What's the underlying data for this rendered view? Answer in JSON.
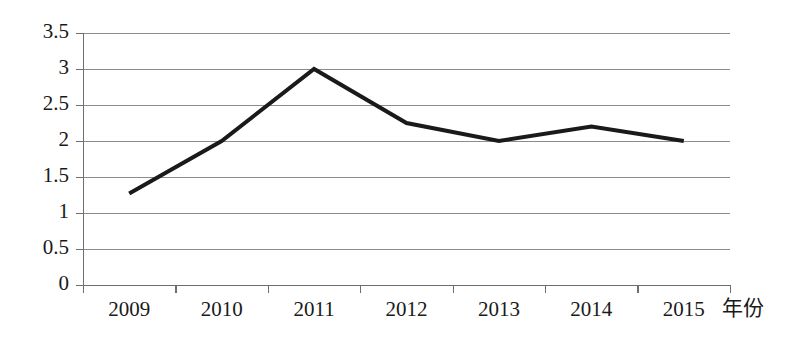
{
  "chart_data": {
    "type": "line",
    "title": "",
    "subtitle": "",
    "xlabel": "年份",
    "ylabel": "",
    "categories": [
      "2009",
      "2010",
      "2011",
      "2012",
      "2013",
      "2014",
      "2015"
    ],
    "values": [
      1.27,
      2.0,
      3.0,
      2.25,
      2.0,
      2.2,
      2.0
    ],
    "series": [
      {
        "name": "",
        "values": [
          1.27,
          2.0,
          3.0,
          2.25,
          2.0,
          2.2,
          2.0
        ]
      }
    ],
    "ylim": [
      0,
      3.5
    ],
    "yticks": [
      0,
      0.5,
      1,
      1.5,
      2,
      2.5,
      3,
      3.5
    ],
    "ytick_labels": [
      "0",
      "0.5",
      "1",
      "1.5",
      "2",
      "2.5",
      "3",
      "3.5"
    ],
    "xtick_labels": [
      "2009",
      "2010",
      "2011",
      "2012",
      "2013",
      "2014",
      "2015"
    ],
    "grid": true,
    "grid_axis": "y",
    "legend": false,
    "legend_position": "none",
    "annotations": [],
    "colors": {
      "line": "#1a1a1a",
      "gridline": "#8c8c8c",
      "axis": "#6e6e6e",
      "background": "#ffffff",
      "text": "#1a1a1a"
    }
  },
  "layout": {
    "width": 791,
    "height": 348,
    "plot_left": 83,
    "plot_right": 730,
    "plot_top": 33,
    "plot_bottom": 285,
    "xaxis_title_x": 722,
    "xaxis_title_y": 300
  }
}
